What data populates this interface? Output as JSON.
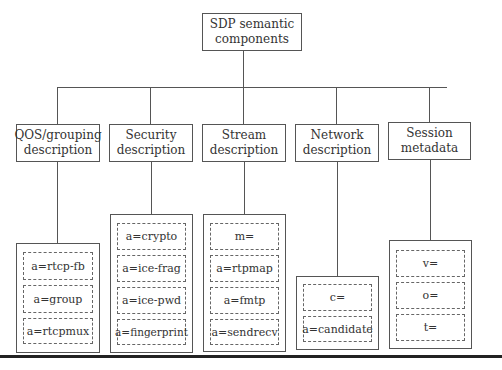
{
  "diagram": {
    "root": {
      "label_line1": "SDP semantic",
      "label_line2": "components"
    },
    "categories": [
      {
        "label_line1": "QOS/grouping",
        "label_line2": "description",
        "items": [
          "a=rtcp-fb",
          "a=group",
          "a=rtcpmux"
        ]
      },
      {
        "label_line1": "Security",
        "label_line2": "description",
        "items": [
          "a=crypto",
          "a=ice-frag",
          "a=ice-pwd",
          "a=fingerprint"
        ]
      },
      {
        "label_line1": "Stream",
        "label_line2": "description",
        "items": [
          "m=",
          "a=rtpmap",
          "a=fmtp",
          "a=sendrecv"
        ]
      },
      {
        "label_line1": "Network",
        "label_line2": "description",
        "items": [
          "c=",
          "a=candidate"
        ]
      },
      {
        "label_line1": "Session",
        "label_line2": "metadata",
        "items": [
          "v=",
          "o=",
          "t="
        ]
      }
    ]
  }
}
